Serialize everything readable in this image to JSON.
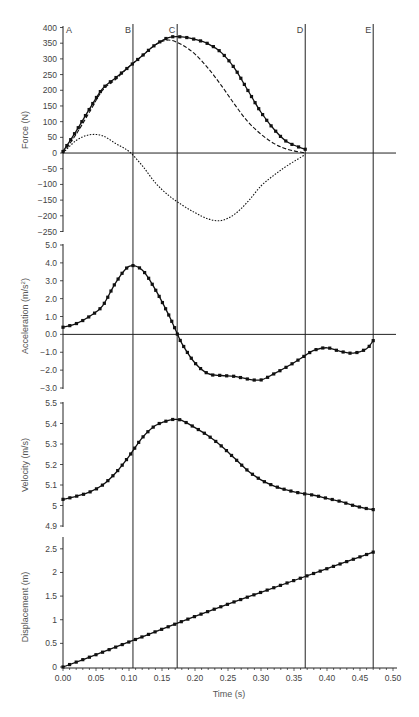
{
  "chart_data": [
    {
      "type": "line",
      "panel": "force",
      "ylabel": "Force (N)",
      "ylim": [
        -250,
        400
      ],
      "yticks": [
        400,
        350,
        300,
        250,
        200,
        150,
        100,
        50,
        0,
        -50,
        -100,
        -150,
        -200,
        -250
      ],
      "ytick_labels": [
        "400",
        "350",
        "300",
        "250",
        "200",
        "150",
        "100",
        "50",
        "0",
        "−50",
        "−100",
        "−150",
        "−200",
        "−250"
      ],
      "x": [
        0.0,
        0.02,
        0.04,
        0.06,
        0.08,
        0.1,
        0.12,
        0.14,
        0.16,
        0.18,
        0.2,
        0.22,
        0.24,
        0.26,
        0.28,
        0.3,
        0.32,
        0.34,
        0.367
      ],
      "series": [
        {
          "name": "Total force (measured)",
          "style": "solid-with-markers",
          "values": [
            5,
            70,
            140,
            205,
            240,
            275,
            310,
            345,
            368,
            370,
            362,
            348,
            320,
            270,
            200,
            130,
            75,
            35,
            12
          ]
        },
        {
          "name": "Component force 1",
          "style": "dashed",
          "values": [
            0,
            60,
            130,
            200,
            235,
            275,
            310,
            345,
            360,
            345,
            315,
            270,
            215,
            155,
            100,
            60,
            30,
            12,
            0
          ]
        },
        {
          "name": "Component force 2",
          "style": "dotted",
          "values": [
            0,
            40,
            58,
            55,
            30,
            5,
            -40,
            -95,
            -135,
            -165,
            -190,
            -210,
            -215,
            -195,
            -155,
            -105,
            -70,
            -40,
            -5
          ]
        }
      ],
      "hline": 0
    },
    {
      "type": "line",
      "panel": "acceleration",
      "ylabel": "Acceleration (m/s²)",
      "ylabel_main": "Acceleration (m/s",
      "ylabel_sup": "2",
      "ylabel_end": ")",
      "ylim": [
        -3.0,
        5.0
      ],
      "yticks": [
        5.0,
        4.0,
        3.0,
        2.0,
        1.0,
        0.0,
        -1.0,
        -2.0,
        -3.0
      ],
      "ytick_labels": [
        "5.0",
        "4.0",
        "3.0",
        "2.0",
        "1.0",
        "0.0",
        "−1.0",
        "−2.0",
        "−3.0"
      ],
      "x": [
        0.0,
        0.02,
        0.04,
        0.06,
        0.08,
        0.1,
        0.12,
        0.14,
        0.16,
        0.17,
        0.18,
        0.2,
        0.22,
        0.24,
        0.26,
        0.28,
        0.3,
        0.32,
        0.34,
        0.36,
        0.38,
        0.4,
        0.42,
        0.44,
        0.46,
        0.47
      ],
      "series": [
        {
          "name": "Acceleration",
          "style": "solid-with-markers",
          "values": [
            0.4,
            0.6,
            1.0,
            1.6,
            2.9,
            3.8,
            3.6,
            2.5,
            1.1,
            0.3,
            -0.5,
            -1.6,
            -2.2,
            -2.3,
            -2.35,
            -2.5,
            -2.55,
            -2.2,
            -1.8,
            -1.35,
            -0.9,
            -0.75,
            -0.95,
            -1.05,
            -0.8,
            -0.35
          ]
        }
      ],
      "hline": 0
    },
    {
      "type": "line",
      "panel": "velocity",
      "ylabel": "Velocity (m/s)",
      "ylim": [
        4.9,
        5.5
      ],
      "yticks": [
        5.5,
        5.4,
        5.3,
        5.2,
        5.1,
        5.0,
        4.9
      ],
      "ytick_labels": [
        "5.5",
        "5.4",
        "5.3",
        "5.2",
        "5.1",
        "5",
        "4.9"
      ],
      "x": [
        0.0,
        0.02,
        0.04,
        0.06,
        0.08,
        0.1,
        0.12,
        0.14,
        0.16,
        0.17,
        0.18,
        0.2,
        0.22,
        0.24,
        0.26,
        0.28,
        0.3,
        0.32,
        0.34,
        0.36,
        0.38,
        0.4,
        0.42,
        0.44,
        0.46,
        0.47
      ],
      "series": [
        {
          "name": "Velocity",
          "style": "solid-with-markers",
          "values": [
            5.03,
            5.045,
            5.065,
            5.1,
            5.16,
            5.24,
            5.33,
            5.39,
            5.415,
            5.42,
            5.415,
            5.38,
            5.34,
            5.29,
            5.23,
            5.17,
            5.125,
            5.095,
            5.075,
            5.06,
            5.05,
            5.035,
            5.02,
            5.0,
            4.985,
            4.98
          ]
        }
      ]
    },
    {
      "type": "line",
      "panel": "displacement",
      "ylabel": "Displacement (m)",
      "ylim": [
        0,
        2.75
      ],
      "yticks": [
        2.5,
        2,
        1.5,
        1,
        0.5,
        0
      ],
      "ytick_labels": [
        "2.5",
        "2",
        "1.5",
        "1",
        "0.5",
        "0"
      ],
      "x": [
        0.0,
        0.05,
        0.1,
        0.15,
        0.2,
        0.25,
        0.3,
        0.35,
        0.4,
        0.45,
        0.47
      ],
      "series": [
        {
          "name": "Displacement",
          "style": "solid-with-markers",
          "values": [
            0.0,
            0.26,
            0.53,
            0.8,
            1.07,
            1.33,
            1.58,
            1.83,
            2.08,
            2.33,
            2.43
          ]
        }
      ]
    }
  ],
  "xaxis": {
    "xlabel": "Time (s)",
    "xlim": [
      0,
      0.5
    ],
    "xticks": [
      0.0,
      0.05,
      0.1,
      0.15,
      0.2,
      0.25,
      0.3,
      0.35,
      0.4,
      0.45,
      0.5
    ],
    "xtick_labels": [
      "0.00",
      "0.05",
      "0.10",
      "0.15",
      "0.20",
      "0.25",
      "0.30",
      "0.35",
      "0.40",
      "0.45",
      "0.50"
    ]
  },
  "events": [
    {
      "label": "A",
      "t": 0.0
    },
    {
      "label": "B",
      "t": 0.106
    },
    {
      "label": "C",
      "t": 0.173
    },
    {
      "label": "D",
      "t": 0.367
    },
    {
      "label": "E",
      "t": 0.47
    }
  ],
  "colors": {
    "line": "#111111",
    "axis": "#222222",
    "text": "#444444",
    "background": "#ffffff"
  }
}
